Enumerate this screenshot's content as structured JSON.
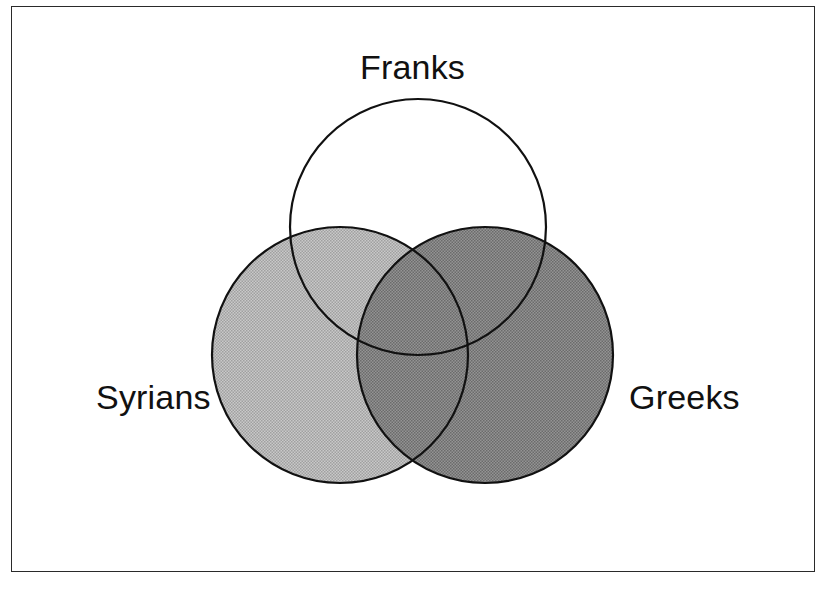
{
  "figure": {
    "kind": "venn-diagram",
    "background_color": "#ffffff",
    "frame": {
      "border_color": "#2a2a2a",
      "border_width_px": 1.5,
      "x": 11,
      "y": 6,
      "width": 804,
      "height": 566
    }
  },
  "chart_data": {
    "type": "diagram",
    "subtype": "venn3",
    "title": "",
    "sets": [
      {
        "id": "franks",
        "label": "Franks",
        "cx": 418,
        "cy": 227,
        "r": 128,
        "fill": "none",
        "fill_hex": "#ffffff",
        "stroke_hex": "#111111",
        "stroke_width": 2.2,
        "label_position": "top",
        "label_x": 418,
        "label_y": 70
      },
      {
        "id": "syrians",
        "label": "Syrians",
        "cx": 340,
        "cy": 355,
        "r": 128,
        "fill": "light-gray-halftone",
        "fill_hex": "#b4b4b4",
        "stroke_hex": "#111111",
        "stroke_width": 2.2,
        "label_position": "left",
        "label_x": 150,
        "label_y": 400
      },
      {
        "id": "greeks",
        "label": "Greeks",
        "cx": 485,
        "cy": 355,
        "r": 128,
        "fill": "dark-gray-halftone",
        "fill_hex": "#828282",
        "stroke_hex": "#111111",
        "stroke_width": 2.2,
        "label_position": "right",
        "label_x": 679,
        "label_y": 400
      }
    ],
    "regions": [
      {
        "id": "franks-only",
        "sets": [
          "franks"
        ],
        "shade_hex": "#ffffff",
        "label": ""
      },
      {
        "id": "syrians-only",
        "sets": [
          "syrians"
        ],
        "shade_hex": "#b4b4b4",
        "label": ""
      },
      {
        "id": "greeks-only",
        "sets": [
          "greeks"
        ],
        "shade_hex": "#828282",
        "label": ""
      },
      {
        "id": "franks-syrians",
        "sets": [
          "franks",
          "syrians"
        ],
        "shade_hex": "#b4b4b4",
        "label": ""
      },
      {
        "id": "franks-greeks",
        "sets": [
          "franks",
          "greeks"
        ],
        "shade_hex": "#828282",
        "label": ""
      },
      {
        "id": "syrians-greeks",
        "sets": [
          "syrians",
          "greeks"
        ],
        "shade_hex": "#828282",
        "label": ""
      },
      {
        "id": "franks-syrians-greeks",
        "sets": [
          "franks",
          "syrians",
          "greeks"
        ],
        "shade_hex": "#828282",
        "label": ""
      }
    ],
    "labels": [
      "Franks",
      "Syrians",
      "Greeks"
    ],
    "legend": null,
    "grid": false
  },
  "labels": {
    "franks": "Franks",
    "syrians": "Syrians",
    "greeks": "Greeks"
  }
}
